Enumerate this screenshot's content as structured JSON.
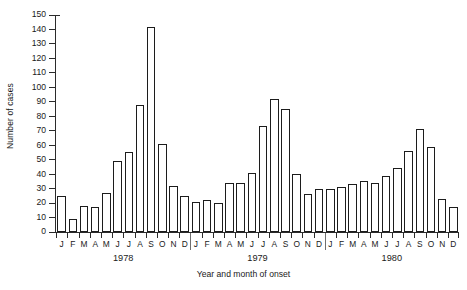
{
  "chart_data": {
    "type": "bar",
    "title": "",
    "xlabel": "Year and month of onset",
    "ylabel": "Number of cases",
    "ylim": [
      0,
      150
    ],
    "ytick_step": 10,
    "yticks": [
      0,
      10,
      20,
      30,
      40,
      50,
      60,
      70,
      80,
      90,
      100,
      110,
      120,
      130,
      140,
      150
    ],
    "grid": false,
    "legend": null,
    "bar_color": "#ffffff",
    "bar_edge_color": "#1c1c1c",
    "axis_color": "#2b2b2b",
    "month_labels": [
      "J",
      "F",
      "M",
      "A",
      "M",
      "J",
      "J",
      "A",
      "S",
      "O",
      "N",
      "D"
    ],
    "group_labels": [
      "1978",
      "1979",
      "1980"
    ],
    "categories": [
      "1978-J",
      "1978-F",
      "1978-M",
      "1978-A",
      "1978-M",
      "1978-J",
      "1978-J",
      "1978-A",
      "1978-S",
      "1978-O",
      "1978-N",
      "1978-D",
      "1979-J",
      "1979-F",
      "1979-M",
      "1979-A",
      "1979-M",
      "1979-J",
      "1979-J",
      "1979-A",
      "1979-S",
      "1979-O",
      "1979-N",
      "1979-D",
      "1980-J",
      "1980-F",
      "1980-M",
      "1980-A",
      "1980-M",
      "1980-J",
      "1980-J",
      "1980-A",
      "1980-S",
      "1980-O",
      "1980-N",
      "1980-D"
    ],
    "values": [
      25,
      9,
      18,
      17,
      27,
      49,
      55,
      88,
      142,
      61,
      32,
      25,
      21,
      22,
      20,
      34,
      34,
      41,
      73,
      92,
      85,
      40,
      26,
      30,
      30,
      31,
      33,
      35,
      34,
      39,
      44,
      56,
      71,
      59,
      23,
      17
    ],
    "series": [
      {
        "name": "Number of cases",
        "values": [
          25,
          9,
          18,
          17,
          27,
          49,
          55,
          88,
          142,
          61,
          32,
          25,
          21,
          22,
          20,
          34,
          34,
          41,
          73,
          92,
          85,
          40,
          26,
          30,
          30,
          31,
          33,
          35,
          34,
          39,
          44,
          56,
          71,
          59,
          23,
          17
        ]
      }
    ],
    "groups": [
      {
        "year": "1978",
        "values": [
          25,
          9,
          18,
          17,
          27,
          49,
          55,
          88,
          142,
          61,
          32,
          25
        ]
      },
      {
        "year": "1979",
        "values": [
          21,
          22,
          20,
          34,
          34,
          41,
          73,
          92,
          85,
          40,
          26,
          30
        ]
      },
      {
        "year": "1980",
        "values": [
          30,
          31,
          33,
          35,
          34,
          39,
          44,
          56,
          71,
          59,
          23,
          17
        ]
      }
    ],
    "peak": {
      "category": "1978-S",
      "value": 142
    }
  }
}
